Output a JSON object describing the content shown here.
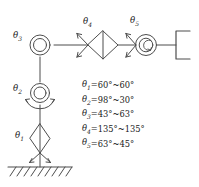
{
  "figure": {
    "kind": "kinematic-chain-diagram",
    "background_color": "#ffffff",
    "line_color": "#4d4d4d",
    "text_color": "#1a1a1a",
    "joint_labels": [
      {
        "id": "theta1",
        "symbol": "θ",
        "subscript": "1",
        "joint_type": "prismatic-diamond"
      },
      {
        "id": "theta2",
        "symbol": "θ",
        "subscript": "2",
        "joint_type": "revolute-double-circle"
      },
      {
        "id": "theta3",
        "symbol": "θ",
        "subscript": "3",
        "joint_type": "revolute-double-circle"
      },
      {
        "id": "theta4",
        "symbol": "θ",
        "subscript": "4",
        "joint_type": "prismatic-diamond"
      },
      {
        "id": "theta5",
        "symbol": "θ",
        "subscript": "5",
        "joint_type": "revolute-double-circle"
      }
    ],
    "end_effector": "gripper-bracket",
    "base": "hatched-ground",
    "ground_hatch_count": 9,
    "ranges": [
      {
        "symbol": "θ",
        "subscript": "1",
        "value": "=60°~60°"
      },
      {
        "symbol": "θ",
        "subscript": "2",
        "value": "=98°~30°"
      },
      {
        "symbol": "θ",
        "subscript": "3",
        "value": "=43°~63°"
      },
      {
        "symbol": "θ",
        "subscript": "4",
        "value": "=135°~135°"
      },
      {
        "symbol": "θ",
        "subscript": "5",
        "value": "=63°~45°"
      }
    ]
  }
}
